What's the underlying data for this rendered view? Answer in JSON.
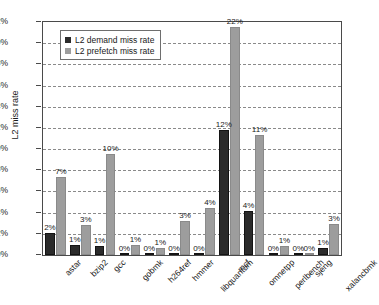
{
  "chart_data": {
    "type": "bar",
    "title": "",
    "xlabel": "",
    "ylabel": "L2 miss rate",
    "ylim": [
      0,
      22
    ],
    "ytick_labels": [
      "0%",
      "2%",
      "4%",
      "6%",
      "8%",
      "10%",
      "12%",
      "14%",
      "16%",
      "18%",
      "20%",
      "22%"
    ],
    "ytick_values": [
      0,
      2,
      4,
      6,
      8,
      10,
      12,
      14,
      16,
      18,
      20,
      22
    ],
    "grid": true,
    "legend_position": "top-left-inside",
    "categories": [
      "astar",
      "bzip2",
      "gcc",
      "gobmk",
      "h264ref",
      "hmmer",
      "libquantum",
      "mcf",
      "omnetpp",
      "perlbench",
      "sjeng",
      "xalancbmk"
    ],
    "series": [
      {
        "name": "L2 demand miss rate",
        "color": "#2b2b2b",
        "values": [
          2.1,
          0.95,
          0.85,
          0.1,
          0.1,
          0.12,
          0.08,
          11.8,
          4.2,
          0.1,
          0.08,
          0.7
        ],
        "labels": [
          "2%",
          "1%",
          "1%",
          "0%",
          "0%",
          "0%",
          "0%",
          "12%",
          "4%",
          "0%",
          "0%",
          "1%"
        ]
      },
      {
        "name": "L2 prefetch miss rate",
        "color": "#9d9d9d",
        "values": [
          7.35,
          2.85,
          9.5,
          0.95,
          0.65,
          3.2,
          4.4,
          21.5,
          11.3,
          0.85,
          0.1,
          2.9
        ],
        "labels": [
          "7%",
          "3%",
          "10%",
          "1%",
          "1%",
          "3%",
          "4%",
          "22%",
          "11%",
          "1%",
          "0%",
          "3%"
        ]
      }
    ]
  }
}
